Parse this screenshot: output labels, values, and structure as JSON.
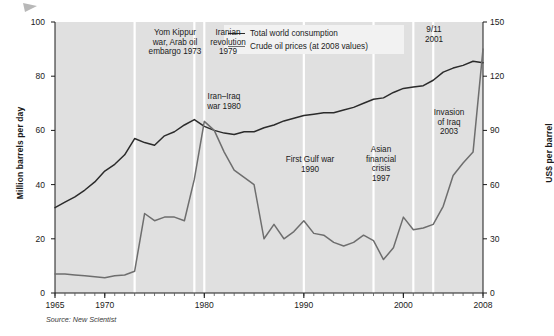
{
  "meta": {
    "source_note": "Source: New Scientist",
    "corner_icon": "arrow-marker-icon",
    "bg_color": "#e0e0e0",
    "consumption_color": "#2b2b2b",
    "price_color": "#6e6e6e",
    "marker_color": "#ffffff"
  },
  "legend": {
    "position": "top-center-right",
    "items": [
      {
        "label": "Total world consumption",
        "key": "consumption"
      },
      {
        "label": "Crude oil prices (at 2008 values)",
        "key": "price"
      }
    ]
  },
  "annotations": [
    {
      "id": "yom-kippur",
      "text": "Yom Kippur\nwar, Arab oil\nembargo 1973",
      "year": 1973,
      "x": 136,
      "y": 28,
      "align": "center",
      "w": 78
    },
    {
      "id": "iranian-rev",
      "text": "Iranian\nrevolution\n1979",
      "year": 1979,
      "x": 199,
      "y": 28,
      "align": "center",
      "w": 58
    },
    {
      "id": "iran-iraq",
      "text": "Iran–Iraq\nwar 1980",
      "year": 1980,
      "x": 196,
      "y": 92,
      "align": "center",
      "w": 56
    },
    {
      "id": "first-gulf",
      "text": "First Gulf war\n1990",
      "year": 1990,
      "x": 274,
      "y": 155,
      "align": "center",
      "w": 72
    },
    {
      "id": "asian-crisis",
      "text": "Asian\nfinancial\ncrisis\n1997",
      "year": 1997,
      "x": 355,
      "y": 145,
      "align": "center",
      "w": 52
    },
    {
      "id": "nine-eleven",
      "text": "9/11\n2001",
      "year": 2001,
      "x": 412,
      "y": 25,
      "align": "center",
      "w": 44
    },
    {
      "id": "invasion-iraq",
      "text": "Invasion\nof Iraq\n2003",
      "year": 2003,
      "x": 423,
      "y": 108,
      "align": "center",
      "w": 52
    }
  ],
  "chart_data": {
    "type": "line",
    "title": "",
    "subtitle": "",
    "xlabel": "",
    "ylabel": "Million barrels per day",
    "ylabel_right": "US$ per barrel",
    "xlim": [
      1965,
      2008
    ],
    "ylim": [
      0,
      100
    ],
    "ylim_right": [
      0,
      150
    ],
    "yticks": [
      0,
      20,
      40,
      60,
      80,
      100
    ],
    "yticks_right": [
      0,
      30,
      60,
      90,
      120,
      150
    ],
    "xticks": [
      1965,
      1970,
      1980,
      1990,
      2000,
      2008
    ],
    "xticks_minor_step": 1,
    "grid": false,
    "legend_position": "top-center",
    "series": [
      {
        "name": "Total world consumption",
        "axis": "left",
        "unit": "million barrels per day",
        "color": "#2b2b2b",
        "x": [
          1965,
          1966,
          1967,
          1968,
          1969,
          1970,
          1971,
          1972,
          1973,
          1974,
          1975,
          1976,
          1977,
          1978,
          1979,
          1980,
          1981,
          1982,
          1983,
          1984,
          1985,
          1986,
          1987,
          1988,
          1989,
          1990,
          1991,
          1992,
          1993,
          1994,
          1995,
          1996,
          1997,
          1998,
          1999,
          2000,
          2001,
          2002,
          2003,
          2004,
          2005,
          2006,
          2007,
          2008
        ],
        "values": [
          31.5,
          33.5,
          35.5,
          38.0,
          41.0,
          45.0,
          47.5,
          51.0,
          57.0,
          55.5,
          54.5,
          58.0,
          59.5,
          62.0,
          64.0,
          61.5,
          60.0,
          59.0,
          58.5,
          59.5,
          59.5,
          61.0,
          62.0,
          63.5,
          64.5,
          65.5,
          66.0,
          66.5,
          66.5,
          67.5,
          68.5,
          70.0,
          71.5,
          72.0,
          74.0,
          75.5,
          76.0,
          76.5,
          78.5,
          81.5,
          83.0,
          84.0,
          85.5,
          85.0
        ]
      },
      {
        "name": "Crude oil prices (at 2008 values)",
        "axis": "right",
        "unit": "US$ per barrel (2008 values)",
        "color": "#6e6e6e",
        "x": [
          1965,
          1966,
          1967,
          1968,
          1969,
          1970,
          1971,
          1972,
          1973,
          1974,
          1975,
          1976,
          1977,
          1978,
          1979,
          1980,
          1981,
          1982,
          1983,
          1984,
          1985,
          1986,
          1987,
          1988,
          1989,
          1990,
          1991,
          1992,
          1993,
          1994,
          1995,
          1996,
          1997,
          1998,
          1999,
          2000,
          2001,
          2002,
          2003,
          2004,
          2005,
          2006,
          2007,
          2008
        ],
        "values": [
          10.5,
          10.5,
          10.0,
          9.5,
          9.0,
          8.5,
          9.5,
          10.0,
          12.0,
          44.0,
          40.0,
          42.0,
          42.0,
          40.0,
          63.0,
          95.0,
          90.0,
          78.0,
          68.0,
          64.0,
          60.0,
          30.0,
          38.0,
          30.0,
          34.0,
          40.0,
          33.0,
          32.0,
          28.0,
          26.0,
          28.0,
          32.0,
          29.0,
          18.5,
          25.0,
          42.0,
          35.0,
          36.0,
          38.0,
          48.0,
          65.0,
          72.0,
          78.0,
          135.0
        ]
      }
    ]
  }
}
